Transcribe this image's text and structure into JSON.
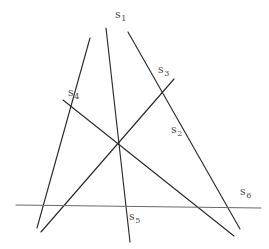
{
  "figure": {
    "width": 269,
    "height": 249,
    "background": "#ffffff",
    "ink_color": "#2b2b2b",
    "axis_color": "#6a6a6a",
    "label_color": "#4a4a4a",
    "style": "hand-drawn line diagram, six straight lines labelled s1..s6"
  },
  "labels": [
    {
      "name": "label-s1",
      "base": "s",
      "sub": "1",
      "x": 115,
      "y": 9
    },
    {
      "name": "label-s2",
      "base": "s",
      "sub": "2",
      "x": 171,
      "y": 124
    },
    {
      "name": "label-s3",
      "base": "s",
      "sub": "3",
      "x": 158,
      "y": 64
    },
    {
      "name": "label-s4",
      "base": "s",
      "sub": "4",
      "x": 68,
      "y": 87
    },
    {
      "name": "label-s5",
      "base": "s",
      "sub": "5",
      "x": 129,
      "y": 211
    },
    {
      "name": "label-s6",
      "base": "s",
      "sub": "6",
      "x": 240,
      "y": 186
    }
  ],
  "lines": [
    {
      "name": "line-s1",
      "label": "s1",
      "x1": 106,
      "y1": 28,
      "x2": 130,
      "y2": 242,
      "kind": "ink"
    },
    {
      "name": "line-s2",
      "label": "s2",
      "x1": 128,
      "y1": 32,
      "x2": 240,
      "y2": 229,
      "kind": "ink"
    },
    {
      "name": "line-s3",
      "label": "s3",
      "x1": 174,
      "y1": 79,
      "x2": 41,
      "y2": 232,
      "kind": "ink"
    },
    {
      "name": "line-s4",
      "label": "s4",
      "x1": 63,
      "y1": 100,
      "x2": 234,
      "y2": 236,
      "kind": "ink"
    },
    {
      "name": "line-s5",
      "label": "s5",
      "x1": 90,
      "y1": 38,
      "x2": 37,
      "y2": 228,
      "kind": "ink"
    },
    {
      "name": "line-s6",
      "label": "s6",
      "x1": 16,
      "y1": 205,
      "x2": 261,
      "y2": 208,
      "kind": "axis"
    }
  ],
  "intersections": [
    {
      "name": "vertex-top",
      "x": 110,
      "y": 63
    },
    {
      "name": "vertex-center",
      "x": 117,
      "y": 134
    },
    {
      "name": "vertex-bottom-left",
      "x": 50,
      "y": 206
    },
    {
      "name": "vertex-bottom-right",
      "x": 218,
      "y": 207
    }
  ]
}
